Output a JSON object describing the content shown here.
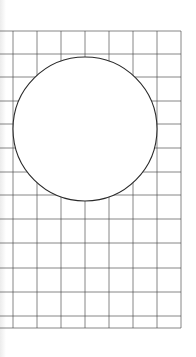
{
  "diagram": {
    "colors": {
      "background": "#ffffff",
      "grid_line": "#4a4a4a",
      "circle_stroke": "#2a2a2a",
      "circle_fill": "#ffffff"
    },
    "grid": {
      "x_start": 0,
      "x_end": 181,
      "vertical_lines_x": [
        13,
        37,
        61,
        85,
        109,
        133,
        157,
        181
      ],
      "y_top": 31,
      "y_bottom": 328,
      "horizontal_lines_y": [
        31,
        54,
        77,
        101,
        124,
        148,
        172,
        195,
        219,
        243,
        268,
        292,
        316,
        328
      ]
    },
    "circle": {
      "cx": 85,
      "cy": 129,
      "r": 72
    }
  }
}
